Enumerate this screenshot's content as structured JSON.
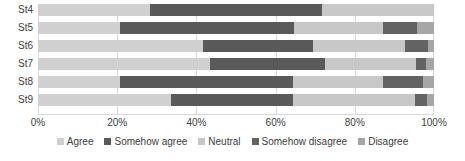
{
  "chart_data": {
    "type": "bar",
    "orientation": "horizontal",
    "stacked": true,
    "normalized_percent": true,
    "title": "",
    "xlabel": "",
    "ylabel": "",
    "xlim": [
      0,
      100
    ],
    "grid": true,
    "legend_position": "bottom",
    "categories": [
      "St4",
      "St5",
      "St6",
      "St7",
      "St8",
      "St9"
    ],
    "xticks": [
      0,
      20,
      40,
      60,
      80,
      100
    ],
    "xtick_labels": [
      "0%",
      "20%",
      "40%",
      "60%",
      "80%",
      "100%"
    ],
    "series": [
      {
        "name": "Agree",
        "color": "#d0d0d0",
        "values": [
          28.3,
          20.7,
          41.7,
          43.4,
          20.7,
          33.6
        ]
      },
      {
        "name": "Somehow agree",
        "color": "#595959",
        "values": [
          43.4,
          43.9,
          27.8,
          29.0,
          43.7,
          30.8
        ]
      },
      {
        "name": "Neutral",
        "color": "#c8c8c8",
        "values": [
          28.3,
          22.5,
          23.2,
          23.0,
          22.7,
          30.8
        ]
      },
      {
        "name": "Somehow disagree",
        "color": "#636363",
        "values": [
          0.0,
          8.6,
          5.8,
          2.5,
          10.1,
          3.0
        ]
      },
      {
        "name": "Disagree",
        "color": "#a6a6a6",
        "values": [
          0.0,
          4.3,
          1.5,
          2.1,
          2.8,
          1.8
        ]
      }
    ]
  },
  "legend": {
    "items": [
      {
        "label": "Agree"
      },
      {
        "label": "Somehow agree"
      },
      {
        "label": "Neutral"
      },
      {
        "label": "Somehow disagree"
      },
      {
        "label": "Disagree"
      }
    ]
  },
  "colors": {
    "agree": "#d0d0d0",
    "somehow_agree": "#595959",
    "neutral": "#c8c8c8",
    "somehow_disagree": "#636363",
    "disagree": "#a6a6a6",
    "gridline": "#d9d9d9",
    "text": "#404040",
    "background": "#ffffff"
  }
}
